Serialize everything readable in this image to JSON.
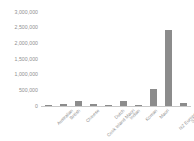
{
  "chart_data": {
    "type": "bar",
    "title": "",
    "subtitle": "",
    "xlabel": "",
    "ylabel": "",
    "categories": [
      "Australian",
      "British",
      "Chinese",
      "Cook Island Maori",
      "Dutch",
      "Indian",
      "Korean",
      "Maori",
      "NZ European",
      "Samoan"
    ],
    "values": [
      25000,
      70000,
      170000,
      60000,
      28000,
      155000,
      35000,
      540000,
      2430000,
      110000
    ],
    "ylim": [
      0,
      3000000
    ],
    "yticks": [
      0,
      500000,
      1000000,
      1500000,
      2000000,
      2500000,
      3000000
    ],
    "ytick_labels": [
      "0",
      "500,000",
      "1,000,000",
      "1,500,000",
      "2,000,000",
      "2,500,000",
      "3,000,000"
    ],
    "grid": false,
    "legend": false,
    "legend_position": "none",
    "bar_color": "#8c8c8c",
    "axis_color": "#c9c9c9",
    "tick_label_color": "#8f8f8f"
  }
}
